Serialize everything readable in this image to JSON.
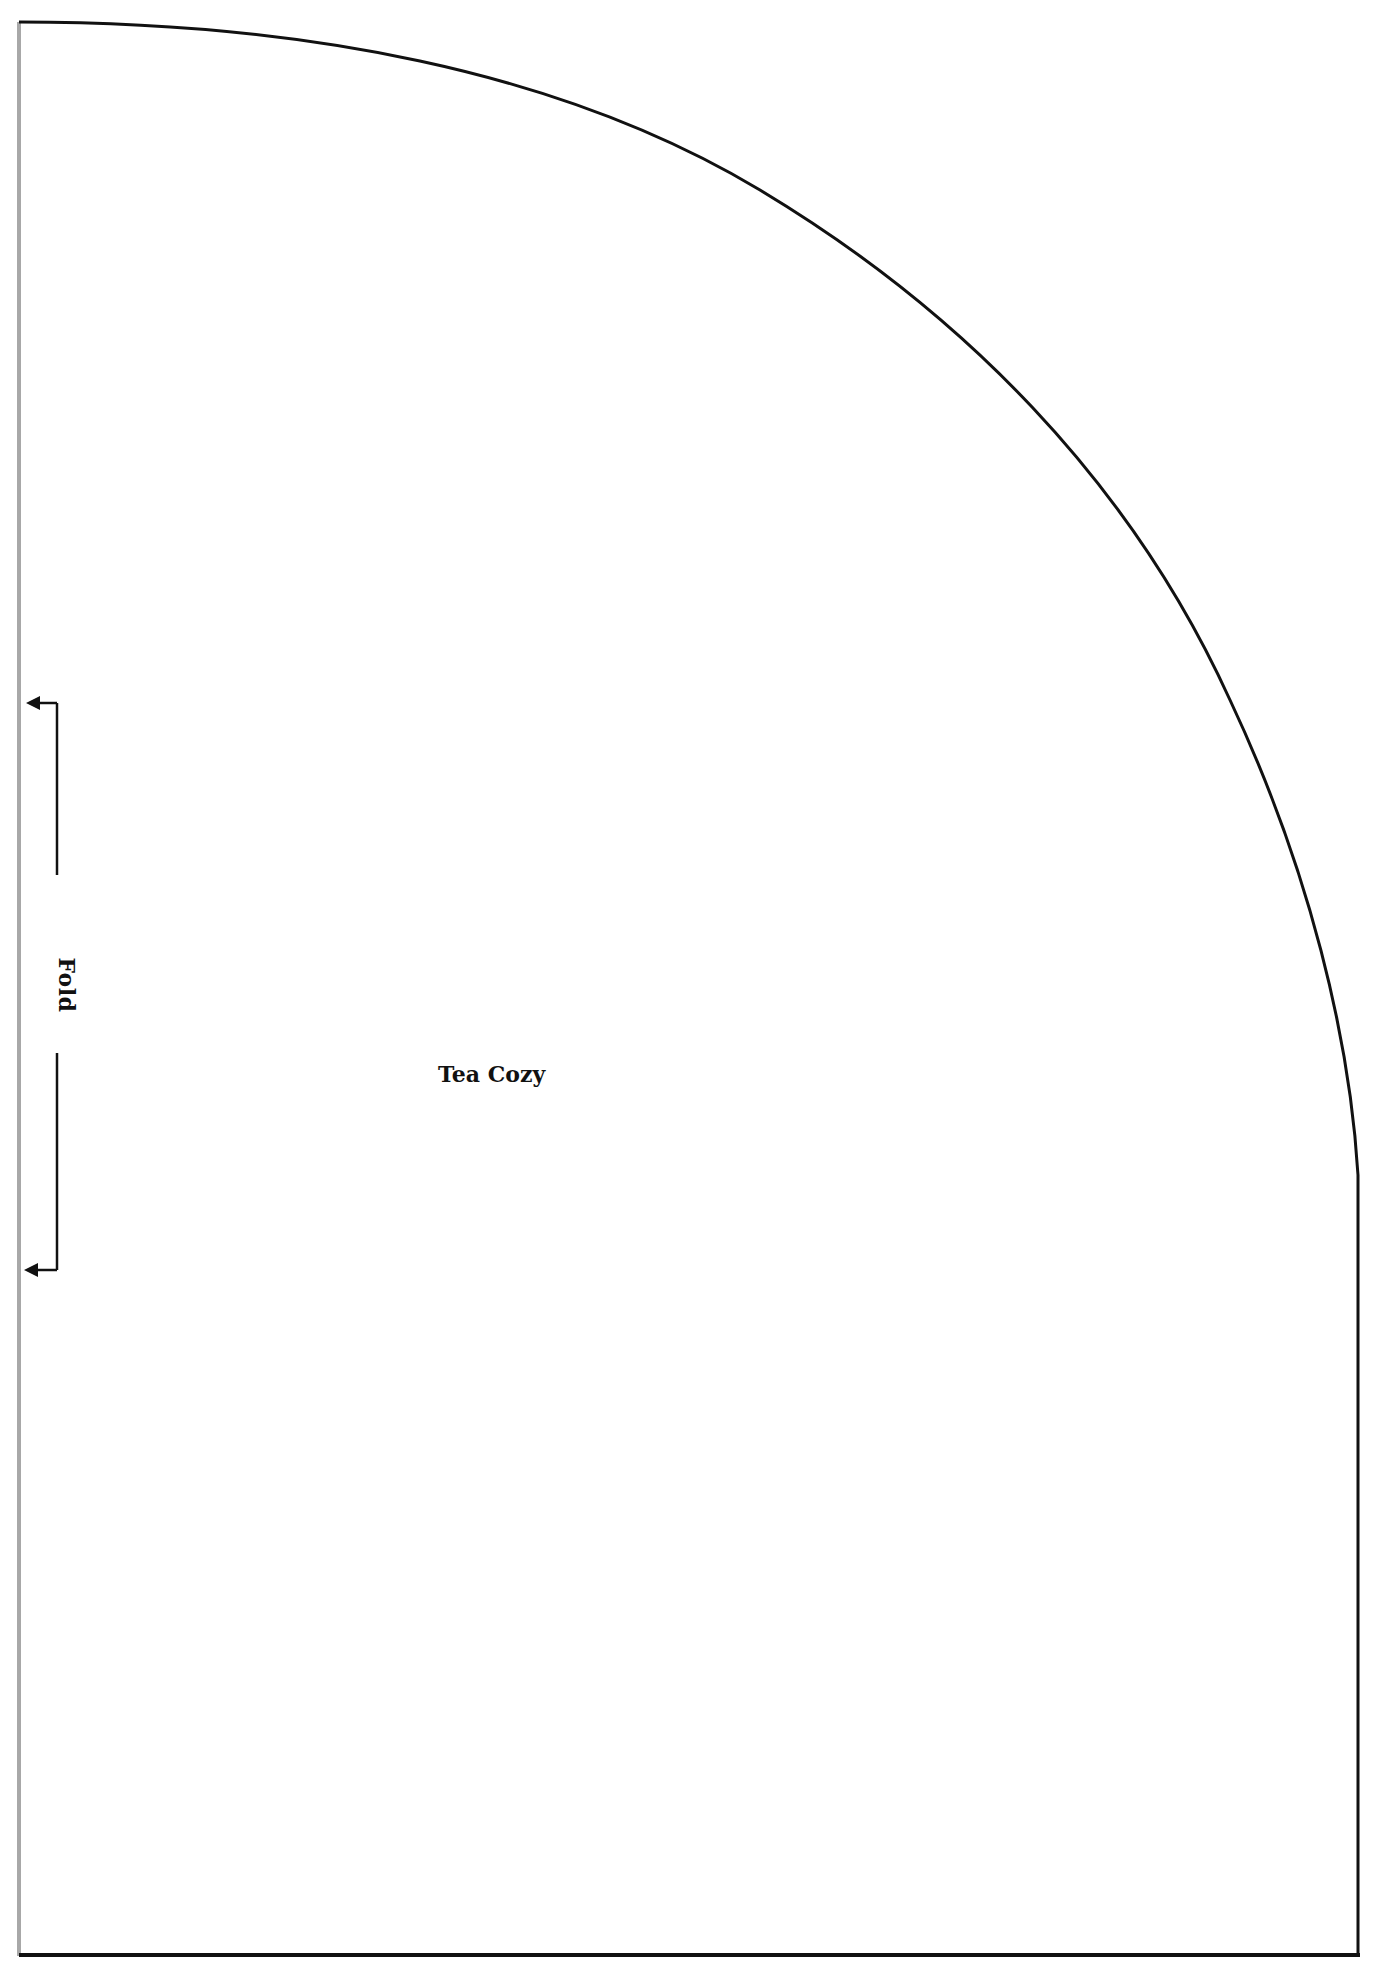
{
  "pattern": {
    "piece_name": "Tea Cozy",
    "fold_label": "Fold",
    "outline_color": "#111111",
    "fold_line_color": "#a8a8a8",
    "background_color": "#ffffff"
  }
}
